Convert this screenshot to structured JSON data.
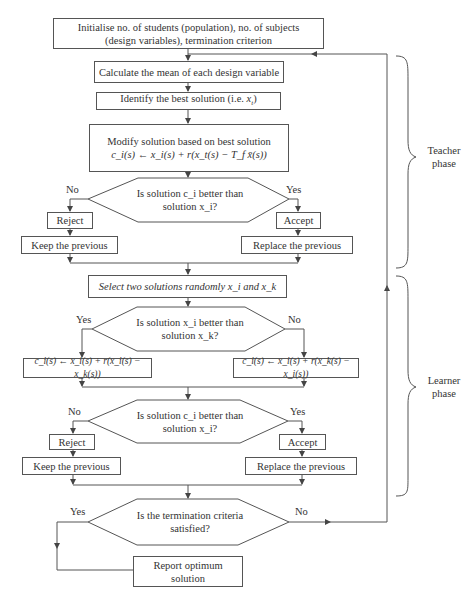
{
  "diagram": {
    "type": "flowchart",
    "nodes": {
      "init": "Initialise no. of students (population), no. of subjects (design variables), termination criterion",
      "init_line1": "Initialise no. of students (population), no. of subjects",
      "init_line2": "(design variables), termination criterion",
      "mean": "Calculate the mean of each design variable",
      "best": "Identify the best solution (i.e. x_t)",
      "best_text": "Identify the best solution (i.e. ",
      "best_var": "x",
      "best_sub": "t",
      "best_end": ")",
      "modify_line1": "Modify solution based on best solution",
      "modify_line2": "c_i(s) ← x_i(s) + r(x_t(s) − T_f x̄(s))",
      "decision1_line1": "Is solution c_i better than",
      "decision1_line2": "solution x_i?",
      "reject1": "Reject",
      "accept1": "Accept",
      "keep1": "Keep the previous",
      "replace1": "Replace the previous",
      "select": "Select two solutions randomly x_i and x_k",
      "decision2_line1": "Is solution x_i better than",
      "decision2_line2": "solution x_k?",
      "formula_left": "c_i(s) ← x_i(s) + r(x_i(s) − x_k(s))",
      "formula_right": "c_i(s) ← x_i(s) + r(x_k(s) − x_i(s))",
      "decision3_line1": "Is solution c_i better than",
      "decision3_line2": "solution x_i?",
      "reject2": "Reject",
      "accept2": "Accept",
      "keep2": "Keep the previous",
      "replace2": "Replace the previous",
      "decision4_line1": "Is the termination criteria",
      "decision4_line2": "satisfied?",
      "report_line1": "Report optimum",
      "report_line2": "solution"
    },
    "edge_labels": {
      "d1_no": "No",
      "d1_yes": "Yes",
      "d2_yes": "Yes",
      "d2_no": "No",
      "d3_no": "No",
      "d3_yes": "Yes",
      "d4_yes": "Yes",
      "d4_no": "No"
    },
    "phases": {
      "teacher_line1": "Teacher",
      "teacher_line2": "phase",
      "learner_line1": "Learner",
      "learner_line2": "phase"
    },
    "colors": {
      "line": "#555555",
      "text": "#333333",
      "background": "#ffffff"
    }
  }
}
